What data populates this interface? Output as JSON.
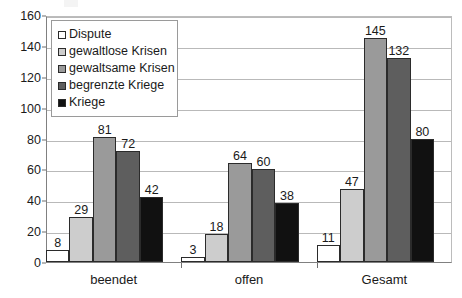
{
  "chart_data": {
    "type": "bar",
    "title": "",
    "subtitle": "",
    "xlabel": "",
    "ylabel": "",
    "categories": [
      "beendet",
      "offen",
      "Gesamt"
    ],
    "series": [
      {
        "name": "Dispute",
        "color": "#ffffff",
        "values": [
          8,
          3,
          11
        ]
      },
      {
        "name": "gewaltlose Krisen",
        "color": "#cdcdcd",
        "values": [
          29,
          18,
          47
        ]
      },
      {
        "name": "gewaltsame Krisen",
        "color": "#9a9a9a",
        "values": [
          81,
          64,
          145
        ]
      },
      {
        "name": "begrenzte Kriege",
        "color": "#5e5e5e",
        "values": [
          72,
          60,
          132
        ]
      },
      {
        "name": "Kriege",
        "color": "#111111",
        "values": [
          42,
          38,
          80
        ]
      }
    ],
    "ylim": [
      0,
      160
    ],
    "ytick_step": 20,
    "yticks": [
      0,
      20,
      40,
      60,
      80,
      100,
      120,
      140,
      160
    ],
    "ytick_labels": [
      "0",
      "20",
      "40",
      "60",
      "80",
      "100",
      "120",
      "140",
      "160"
    ],
    "grid": true,
    "grid_axis": "y",
    "legend_position": "upper-left-inside",
    "data_labels": true,
    "bar_border_color": "#2b2b2b",
    "gridline_color": "#b9b9b9",
    "axis_color": "#808080",
    "background": "#ffffff"
  },
  "legend": {
    "entries": [
      {
        "label": "Dispute"
      },
      {
        "label": "gewaltlose Krisen"
      },
      {
        "label": "gewaltsame Krisen"
      },
      {
        "label": "begrenzte Kriege"
      },
      {
        "label": "Kriege"
      }
    ]
  }
}
